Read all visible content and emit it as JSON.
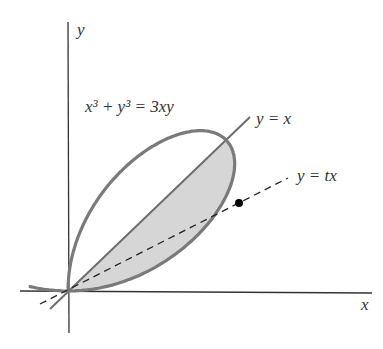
{
  "figure": {
    "equation_label": "x³ + y³ = 3xy",
    "line1_label": "y = x",
    "line2_label": "y = tx",
    "x_axis_label": "x",
    "y_axis_label": "y"
  },
  "chart_data": {
    "type": "diagram",
    "curve": "folium of Descartes x^3 + y^3 = 3xy",
    "lines": [
      "y = x",
      "y = tx (dashed)"
    ],
    "shaded_region": "between curve loop and line y = x, below y = x",
    "marked_point": "intersection of y = tx with curve",
    "t_value_approx": 0.5,
    "colors": {
      "curve": "#7a7a7a",
      "fill": "#d6d6d6",
      "axis": "#333333",
      "dashed": "#222222",
      "line": "#6e6e6e"
    }
  }
}
